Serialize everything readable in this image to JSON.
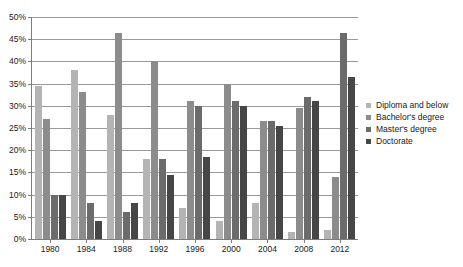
{
  "chart_data": {
    "type": "bar",
    "title": "",
    "xlabel": "",
    "ylabel": "",
    "ylim": [
      0,
      50
    ],
    "ytick_step": 5,
    "ytick_labels": [
      "0%",
      "5%",
      "10%",
      "15%",
      "20%",
      "25%",
      "30%",
      "35%",
      "40%",
      "45%",
      "50%"
    ],
    "grid": true,
    "legend_position": "right",
    "categories": [
      "1980",
      "1984",
      "1988",
      "1992",
      "1996",
      "2000",
      "2004",
      "2008",
      "2012"
    ],
    "series": [
      {
        "name": "Diploma and below",
        "color": "#b4b4b4",
        "values": [
          34.5,
          38.0,
          28.0,
          18.0,
          7.0,
          4.0,
          8.0,
          1.5,
          2.0
        ]
      },
      {
        "name": "Bachelor's degree",
        "color": "#8c8c8c",
        "values": [
          27.0,
          33.0,
          46.5,
          40.0,
          31.0,
          35.0,
          26.5,
          29.5,
          14.0
        ]
      },
      {
        "name": "Master's degree",
        "color": "#6b6b6b",
        "values": [
          10.0,
          8.0,
          6.0,
          18.0,
          30.0,
          31.0,
          26.5,
          32.0,
          46.5
        ]
      },
      {
        "name": "Doctorate",
        "color": "#464646",
        "values": [
          10.0,
          4.0,
          8.0,
          14.5,
          18.5,
          30.0,
          25.5,
          31.0,
          36.5
        ]
      }
    ]
  },
  "axis": {
    "gridline_color": "#9a9a9a",
    "frame_color": "#7d7d7d"
  }
}
